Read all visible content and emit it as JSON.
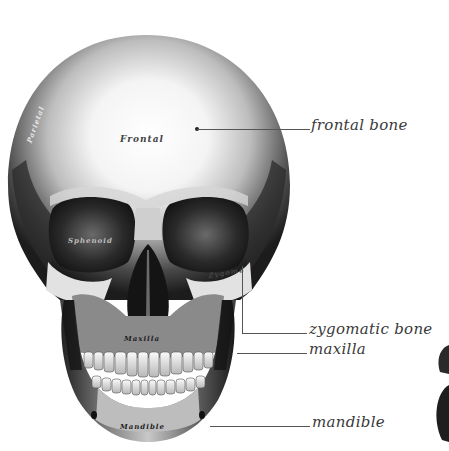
{
  "figure": {
    "style": "engraving"
  },
  "callouts": [
    {
      "id": "frontal",
      "label": "frontal bone",
      "line_y": 129,
      "line_x1": 197,
      "line_x2": 310,
      "text_x": 311,
      "text_y": 118
    },
    {
      "id": "zygomatic",
      "label": "zygomatic bone",
      "line_y": 333,
      "line_x1": 242,
      "line_x2": 307,
      "text_x": 309,
      "text_y": 322
    },
    {
      "id": "maxilla",
      "label": "maxilla",
      "line_y": 353,
      "line_x1": 237,
      "line_x2": 307,
      "text_x": 309,
      "text_y": 342
    },
    {
      "id": "mandible",
      "label": "mandible",
      "line_y": 426,
      "line_x1": 210,
      "line_x2": 310,
      "text_x": 312,
      "text_y": 415
    }
  ],
  "inner_labels": [
    {
      "id": "frontal",
      "text": "Frontal",
      "x": 120,
      "y": 134
    },
    {
      "id": "parietal",
      "text": "Parietal",
      "x": 20,
      "y": 110
    },
    {
      "id": "sphenoid",
      "text": "Sphenoid",
      "x": 68,
      "y": 236
    },
    {
      "id": "zygoma",
      "text": "Zygoma",
      "x": 206,
      "y": 270
    },
    {
      "id": "maxilla",
      "text": "Maxilla",
      "x": 120,
      "y": 338
    },
    {
      "id": "mandible",
      "text": "Mandible",
      "x": 118,
      "y": 424
    }
  ],
  "colors": {
    "background": "#ffffff",
    "label_text": "#3a3a3a",
    "leader_line": "#555555",
    "bone_light": "#f4f4f4",
    "bone_mid": "#9a9a9a",
    "bone_dark": "#1e1e1e"
  }
}
